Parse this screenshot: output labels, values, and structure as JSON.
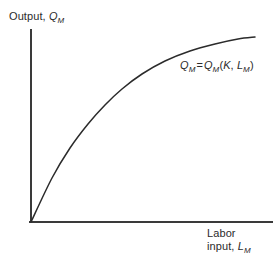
{
  "chart_data": {
    "type": "line",
    "title": "",
    "subtitle": "",
    "xlabel_line1": "Labor",
    "xlabel_line2_prefix": "input, ",
    "xlabel_var": "L",
    "xlabel_sub": "M",
    "ylabel_prefix": "Output, ",
    "ylabel_var": "Q",
    "ylabel_sub": "M",
    "grid": false,
    "legend": "none",
    "axis_color": "#3a3a3a",
    "curve_color": "#2b2b2b",
    "background_color": "#ffffff",
    "text_color": "#2b2b2b",
    "xlim": [
      0,
      10
    ],
    "ylim": [
      0,
      10
    ],
    "annotation": {
      "lhs_var": "Q",
      "lhs_sub": "M",
      "equals": "=",
      "rhs_var": "Q",
      "rhs_sub": "M",
      "open_paren": "(",
      "arg1": "K",
      "comma": ", ",
      "arg2_var": "L",
      "arg2_sub": "M",
      "close_paren": ")",
      "full_text": "QM = QM (K, LM)"
    },
    "series": [
      {
        "name": "Production function",
        "description": "Concave increasing curve through origin showing diminishing marginal returns to labor",
        "x": [
          0.0,
          0.5,
          1.0,
          1.6,
          2.3,
          3.0,
          3.9,
          4.8,
          5.8,
          7.0,
          8.3,
          9.3
        ],
        "y": [
          0.0,
          1.3,
          2.5,
          3.7,
          4.9,
          5.8,
          6.7,
          7.4,
          8.0,
          8.5,
          8.9,
          9.1
        ]
      }
    ],
    "path_points_px": [
      [
        31,
        222
      ],
      [
        52,
        178
      ],
      [
        70,
        148
      ],
      [
        88,
        124
      ],
      [
        105,
        105
      ],
      [
        122,
        89
      ],
      [
        142,
        74
      ],
      [
        165,
        61
      ],
      [
        190,
        51
      ],
      [
        215,
        44
      ],
      [
        238,
        39
      ],
      [
        255,
        37
      ]
    ]
  },
  "axes": {
    "y_axis_x_px": 31,
    "y_axis_top_px": 30,
    "y_axis_bottom_px": 222,
    "x_axis_y_px": 222,
    "x_axis_left_px": 31,
    "x_axis_right_px": 272
  }
}
